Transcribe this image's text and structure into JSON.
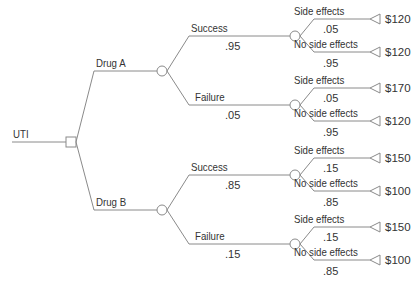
{
  "root": {
    "label": "UTI"
  },
  "options": [
    {
      "label": "Drug A",
      "outcomes": [
        {
          "label": "Success",
          "prob": ".95",
          "effects": [
            {
              "label": "Side effects",
              "prob": ".05",
              "payoff": "$120"
            },
            {
              "label": "No side effects",
              "prob": ".95",
              "payoff": "$120"
            }
          ]
        },
        {
          "label": "Failure",
          "prob": ".05",
          "effects": [
            {
              "label": "Side effects",
              "prob": ".05",
              "payoff": "$170"
            },
            {
              "label": "No side effects",
              "prob": ".95",
              "payoff": "$120"
            }
          ]
        }
      ]
    },
    {
      "label": "Drug B",
      "outcomes": [
        {
          "label": "Success",
          "prob": ".85",
          "effects": [
            {
              "label": "Side effects",
              "prob": ".15",
              "payoff": "$150"
            },
            {
              "label": "No side effects",
              "prob": ".85",
              "payoff": "$100"
            }
          ]
        },
        {
          "label": "Failure",
          "prob": ".15",
          "effects": [
            {
              "label": "Side effects",
              "prob": ".15",
              "payoff": "$150"
            },
            {
              "label": "No side effects",
              "prob": ".85",
              "payoff": "$100"
            }
          ]
        }
      ]
    }
  ],
  "colors": {
    "line": "#8a8a8a",
    "text": "#333333"
  }
}
